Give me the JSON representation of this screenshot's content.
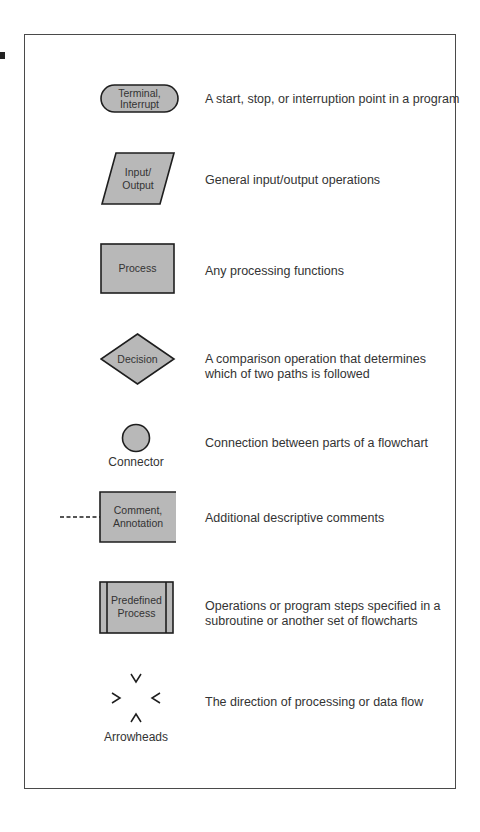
{
  "colors": {
    "shape_fill": "#b8b8b8",
    "stroke": "#1e1e1e",
    "text": "#333333",
    "frame": "#4a4a4a"
  },
  "symbols": [
    {
      "name": "terminal",
      "label_lines": [
        "Terminal,",
        "Interrupt"
      ],
      "description": "A start, stop, or interruption point in a program"
    },
    {
      "name": "input-output",
      "label_lines": [
        "Input/",
        "Output"
      ],
      "description": "General input/output operations"
    },
    {
      "name": "process",
      "label_lines": [
        "Process"
      ],
      "description": "Any processing functions"
    },
    {
      "name": "decision",
      "label_lines": [
        "Decision"
      ],
      "description_lines": [
        "A comparison operation that determines",
        "which of two paths is followed"
      ]
    },
    {
      "name": "connector",
      "caption": "Connector",
      "description": "Connection between parts of a flowchart"
    },
    {
      "name": "comment",
      "label_lines": [
        "Comment,",
        "Annotation"
      ],
      "description": "Additional descriptive comments"
    },
    {
      "name": "predefined-process",
      "label_lines": [
        "Predefined",
        "Process"
      ],
      "description_lines": [
        "Operations or program steps specified in a",
        "subroutine or another set of flowcharts"
      ]
    },
    {
      "name": "arrowheads",
      "caption": "Arrowheads",
      "glyphs": [
        "V",
        ">",
        "<",
        "Λ"
      ],
      "description": "The direction of processing or data flow"
    }
  ]
}
